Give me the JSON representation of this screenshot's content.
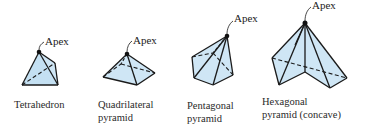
{
  "figure": {
    "apex_label": "Apex",
    "face_fill": "#cfe6f5",
    "edge_color": "#1a1a1a",
    "shapes": [
      {
        "id": "tetrahedron",
        "caption_lines": [
          "Tetrahedron"
        ]
      },
      {
        "id": "quadrilateral-pyramid",
        "caption_lines": [
          "Quadrilateral",
          "pyramid"
        ]
      },
      {
        "id": "pentagonal-pyramid",
        "caption_lines": [
          "Pentagonal",
          "pyramid"
        ]
      },
      {
        "id": "hexagonal-pyramid-concave",
        "caption_lines": [
          "Hexagonal",
          "pyramid (concave)"
        ]
      }
    ]
  }
}
